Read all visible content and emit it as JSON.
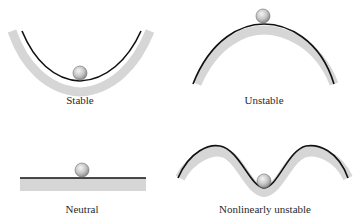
{
  "figure": {
    "panels": [
      {
        "id": "stable",
        "label": "Stable",
        "curve": "concave-up bowl",
        "ball_position": "bottom of bowl"
      },
      {
        "id": "unstable",
        "label": "Unstable",
        "curve": "convex hill",
        "ball_position": "top of hill"
      },
      {
        "id": "neutral",
        "label": "Neutral",
        "curve": "flat surface",
        "ball_position": "on flat surface"
      },
      {
        "id": "nonlinearly-unstable",
        "label": "Nonlinearly unstable",
        "curve": "two hills with central dip",
        "ball_position": "bottom of central dip"
      }
    ],
    "colors": {
      "surface_line": "#111111",
      "surface_fill": "#d6d6d6",
      "ball_light": "#f2f2f2",
      "ball_dark": "#8c8c8c",
      "ball_outline": "#6e6e6e",
      "background": "#ffffff"
    }
  }
}
